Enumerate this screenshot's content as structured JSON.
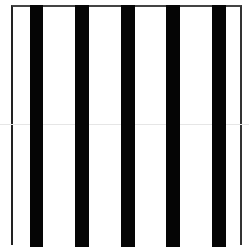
{
  "image": {
    "description": "Black vertical stripes on white background inside a thin bordered frame",
    "background_color": "#ffffff",
    "stripe_color": "#050505",
    "frame": {
      "left": 11,
      "top": 5,
      "right": 242
    },
    "stripes": [
      {
        "left": 30,
        "width": 13
      },
      {
        "left": 75,
        "width": 14
      },
      {
        "left": 121,
        "width": 14
      },
      {
        "left": 166,
        "width": 14
      },
      {
        "left": 212,
        "width": 14
      }
    ],
    "horizontal_line": {
      "top": 124,
      "color": "#e6e6e6"
    }
  }
}
